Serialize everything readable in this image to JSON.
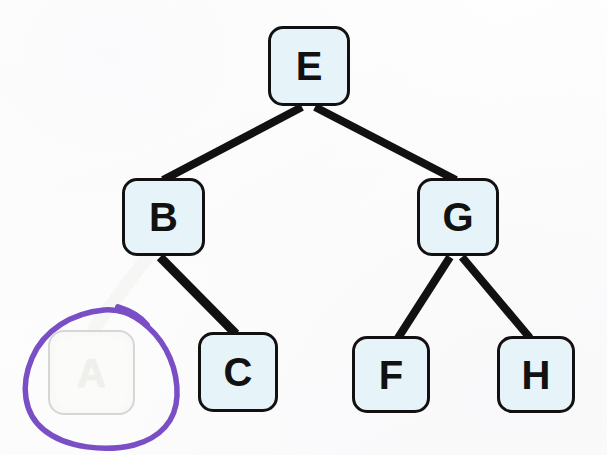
{
  "diagram": {
    "background_color": "#fdfdfd",
    "node_fill_color": "#e6f3f8",
    "node_border_color": "#111111",
    "edge_color": "#111111",
    "annotation_color": "#7a4ec4",
    "faded_node_fill": "#fbfbfa",
    "faded_node_border": "#d6d6d4",
    "faded_label_color": "#efefec"
  },
  "nodes": [
    {
      "id": "E",
      "label": "E",
      "x": 268,
      "y": 26,
      "w": 82,
      "h": 80,
      "state": "normal"
    },
    {
      "id": "B",
      "label": "B",
      "x": 122,
      "y": 178,
      "w": 83,
      "h": 78,
      "state": "normal"
    },
    {
      "id": "G",
      "label": "G",
      "x": 417,
      "y": 178,
      "w": 82,
      "h": 78,
      "state": "normal"
    },
    {
      "id": "A",
      "label": "A",
      "x": 48,
      "y": 330,
      "w": 87,
      "h": 85,
      "state": "erased"
    },
    {
      "id": "C",
      "label": "C",
      "x": 198,
      "y": 332,
      "w": 80,
      "h": 80,
      "state": "normal"
    },
    {
      "id": "F",
      "label": "F",
      "x": 352,
      "y": 336,
      "w": 78,
      "h": 77,
      "state": "normal"
    },
    {
      "id": "H",
      "label": "H",
      "x": 497,
      "y": 336,
      "w": 78,
      "h": 77,
      "state": "normal"
    }
  ],
  "edges": [
    {
      "id": "E-B",
      "from": "E",
      "to": "B",
      "x1": 302,
      "y1": 107,
      "x2": 163,
      "y2": 180,
      "state": "normal"
    },
    {
      "id": "E-G",
      "from": "E",
      "to": "G",
      "x1": 315,
      "y1": 107,
      "x2": 456,
      "y2": 180,
      "state": "normal"
    },
    {
      "id": "B-C",
      "from": "B",
      "to": "C",
      "x1": 160,
      "y1": 257,
      "x2": 236,
      "y2": 334,
      "state": "normal"
    },
    {
      "id": "B-A",
      "from": "B",
      "to": "A",
      "x1": 146,
      "y1": 257,
      "x2": 92,
      "y2": 330,
      "state": "erased"
    },
    {
      "id": "G-F",
      "from": "G",
      "to": "F",
      "x1": 450,
      "y1": 257,
      "x2": 398,
      "y2": 338,
      "state": "normal"
    },
    {
      "id": "G-H",
      "from": "G",
      "to": "H",
      "x1": 462,
      "y1": 257,
      "x2": 530,
      "y2": 338,
      "state": "normal"
    }
  ],
  "annotations": [
    {
      "id": "circle-around-A",
      "type": "hand-drawn-circle",
      "target": "A",
      "color": "#7a4ec4",
      "stroke_width": 5,
      "description": "purple marker circle drawn around the erased node A"
    }
  ]
}
